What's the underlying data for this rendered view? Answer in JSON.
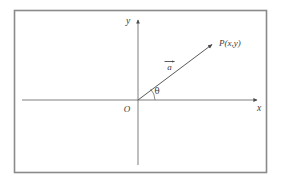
{
  "figure": {
    "name": "vector-in-cartesian-plane",
    "border_color": "#8a8a8a",
    "axis_color": "#6b6b6b",
    "vector_color": "#555555",
    "text_color": "#3c3c3c",
    "background": "#ffffff",
    "frame": {
      "x": 14,
      "y": 10,
      "width": 253,
      "height": 163
    },
    "origin": {
      "x": 138,
      "y": 100
    },
    "axes": {
      "x_label": "x",
      "y_label": "y",
      "x_axis_start_x": 22,
      "x_axis_end_x": 259,
      "y_axis_top_y": 18,
      "y_axis_bottom_y": 165
    },
    "vector": {
      "label": "a",
      "label_x": 170,
      "label_y": 68,
      "tip_x": 214,
      "tip_y": 43
    },
    "point": {
      "label": "P(x,y)",
      "label_x": 219,
      "label_y": 45
    },
    "origin_label": {
      "label": "O",
      "x": 127,
      "y": 112
    },
    "angle": {
      "label": "θ",
      "x": 156,
      "y": 94,
      "arc_radius": 16
    }
  }
}
